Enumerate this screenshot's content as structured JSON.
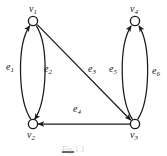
{
  "figure": {
    "background_color": "#ffffff",
    "stroke_color": "#1a1a1a",
    "width": 167,
    "height": 156
  },
  "caption": {
    "text": "Fig 1.1",
    "visible": "partially cropped at bottom edge"
  },
  "nodes": [
    {
      "id": "v1",
      "label": "v",
      "subscript": "1",
      "x": 33,
      "y": 21,
      "r": 4.6,
      "label_x": 29,
      "label_y": 5
    },
    {
      "id": "v2",
      "label": "v",
      "subscript": "2",
      "x": 33,
      "y": 124,
      "r": 4.6,
      "label_x": 27,
      "label_y": 132
    },
    {
      "id": "v3",
      "label": "v",
      "subscript": "3",
      "x": 135,
      "y": 124,
      "r": 4.6,
      "label_x": 130,
      "label_y": 132
    },
    {
      "id": "v4",
      "label": "v",
      "subscript": "4",
      "x": 135,
      "y": 21,
      "r": 4.6,
      "label_x": 130,
      "label_y": 5
    }
  ],
  "edges": [
    {
      "id": "e1",
      "label": "e",
      "subscript": "1",
      "from": "v2",
      "to": "v1",
      "shape": "curve-left",
      "directed": true,
      "label_x": 8,
      "label_y": 64
    },
    {
      "id": "e2",
      "label": "e",
      "subscript": "2",
      "from": "v1",
      "to": "v2",
      "shape": "curve-right",
      "directed": true,
      "label_x": 45,
      "label_y": 66
    },
    {
      "id": "e3",
      "label": "e",
      "subscript": "3",
      "from": "v1",
      "to": "v3",
      "shape": "straight-diagonal",
      "directed": true,
      "label_x": 89,
      "label_y": 66
    },
    {
      "id": "e4",
      "label": "e",
      "subscript": "4",
      "from": "v3",
      "to": "v2",
      "shape": "straight-horizontal",
      "directed": true,
      "label_x": 74,
      "label_y": 106
    },
    {
      "id": "e5",
      "label": "e",
      "subscript": "5",
      "from": "v3",
      "to": "v4",
      "shape": "curve-left",
      "directed": true,
      "label_x": 110,
      "label_y": 66
    },
    {
      "id": "e6",
      "label": "e",
      "subscript": "6",
      "from": "v3",
      "to": "v4",
      "shape": "curve-right",
      "directed": true,
      "label_x": 153,
      "label_y": 68
    }
  ]
}
